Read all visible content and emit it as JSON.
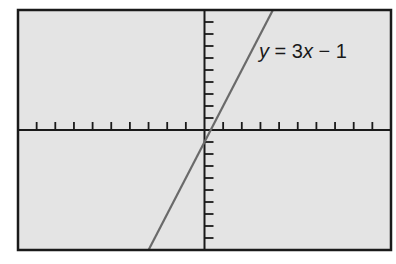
{
  "chart_data": {
    "type": "line",
    "title": "",
    "xlabel": "",
    "ylabel": "",
    "xlim": [
      -10,
      10
    ],
    "ylim": [
      -10,
      10
    ],
    "grid": false,
    "x_ticks_per_side": 9,
    "y_ticks_per_side": 9,
    "tick_labels": false,
    "series": [
      {
        "name": "y = 3x - 1",
        "equation": {
          "slope": 3,
          "intercept": -1
        },
        "x": [
          -3,
          3.667
        ],
        "values": [
          -10,
          10
        ]
      }
    ],
    "annotations": [
      {
        "text": "y = 3x − 1",
        "parts": {
          "v1": "y",
          "eq": " = 3",
          "v2": "x",
          "rest": " − 1"
        },
        "position": {
          "x": 2.6,
          "y": 6
        }
      }
    ],
    "colors": {
      "background": "#e4e4e4",
      "frame": "#1a1a1a",
      "axes": "#1a1a1a",
      "line": "#6a6a6a"
    }
  }
}
